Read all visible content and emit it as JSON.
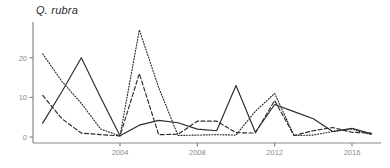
{
  "chart_data": {
    "type": "line",
    "title": "Q. rubra",
    "xlabel": "",
    "ylabel": "",
    "xlim": [
      1999.5,
      2017.5
    ],
    "ylim": [
      -1.5,
      29
    ],
    "xticks": [
      2004,
      2008,
      2012,
      2016
    ],
    "yticks": [
      0,
      10,
      20
    ],
    "grid": false,
    "legend": "none",
    "axis_color": "#8a8a8a",
    "line_color": "#2b2b2b",
    "series": [
      {
        "name": "solid",
        "style": "solid",
        "x": [
          2000,
          2001,
          2002,
          2003,
          2004,
          2005,
          2006,
          2007,
          2008,
          2009,
          2010,
          2011,
          2012,
          2013,
          2014,
          2015,
          2016,
          2017
        ],
        "values": [
          3.5,
          11.5,
          20.0,
          10.0,
          0.3,
          3.0,
          4.2,
          3.6,
          2.0,
          1.6,
          13.0,
          1.2,
          8.2,
          6.4,
          4.6,
          1.4,
          2.2,
          0.8
        ]
      },
      {
        "name": "dotted",
        "style": "dotted",
        "x": [
          2000,
          2001,
          2002,
          2003,
          2004,
          2005,
          2006,
          2007,
          2008,
          2009,
          2010,
          2011,
          2012,
          2013,
          2014,
          2015,
          2016,
          2017
        ],
        "values": [
          21.0,
          14.0,
          8.5,
          2.0,
          0.3,
          27.0,
          12.5,
          0.4,
          0.5,
          0.6,
          0.5,
          6.5,
          11.0,
          0.4,
          0.5,
          1.4,
          2.0,
          0.6
        ]
      },
      {
        "name": "dashed",
        "style": "dashed",
        "x": [
          2000,
          2001,
          2002,
          2003,
          2004,
          2005,
          2006,
          2007,
          2008,
          2009,
          2010,
          2011,
          2012,
          2013,
          2014,
          2015,
          2016,
          2017
        ],
        "values": [
          10.5,
          4.6,
          1.0,
          0.6,
          0.3,
          16.0,
          0.6,
          0.7,
          4.0,
          4.0,
          1.1,
          1.0,
          9.2,
          0.4,
          1.6,
          2.4,
          1.2,
          1.0
        ]
      }
    ]
  }
}
